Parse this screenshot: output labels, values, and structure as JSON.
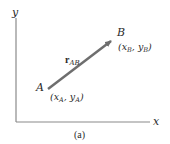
{
  "figure": {
    "caption": "(a)",
    "axes": {
      "x_label": "x",
      "y_label": "y"
    },
    "points": {
      "A": {
        "name": "A",
        "coords_label_pre": "(x",
        "sub1": "A",
        "mid": ", y",
        "sub2": "A",
        "post": ")"
      },
      "B": {
        "name": "B",
        "coords_label_pre": "(x",
        "sub1": "B",
        "mid": ", y",
        "sub2": "B",
        "post": ")"
      }
    },
    "vector": {
      "symbol": "r",
      "subscript": "AB"
    },
    "colors": {
      "axis": "#8a8a8a",
      "vector": "#6e6e6e",
      "text": "#2a2a2a"
    }
  }
}
